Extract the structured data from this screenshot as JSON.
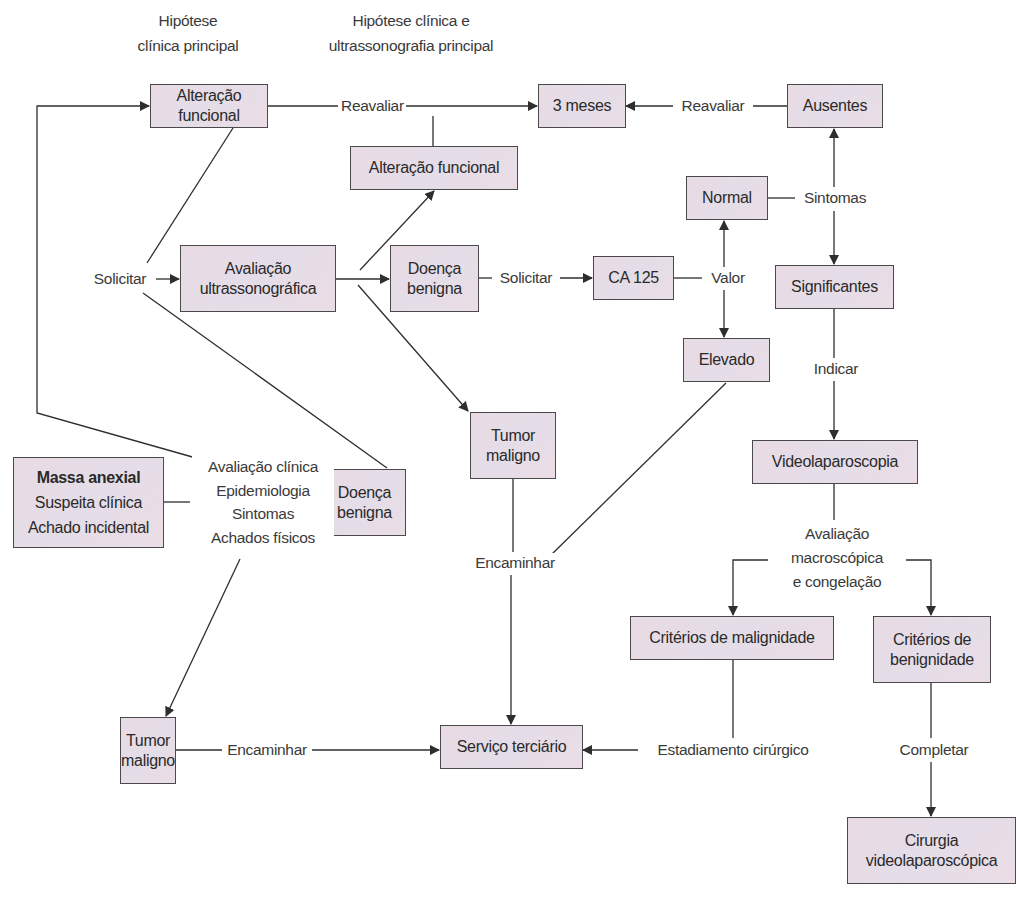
{
  "headers": {
    "col1": "Hipótese\nclínica principal",
    "col2": "Hipótese clínica e\nultrassonografia principal"
  },
  "nodes": {
    "alteracao_funcional_top": "Alteração funcional",
    "tres_meses": "3 meses",
    "ausentes": "Ausentes",
    "alteracao_funcional_us": "Alteração funcional",
    "normal": "Normal",
    "avaliacao_us": "Avaliação\nultrassonográfica",
    "doenca_benigna_us": "Doença\nbenigna",
    "ca125": "CA 125",
    "significantes": "Significantes",
    "elevado": "Elevado",
    "tumor_maligno_us": "Tumor\nmaligno",
    "videolaparoscopia": "Videolaparoscopia",
    "massa_anexial": {
      "title": "Massa anexial",
      "lines": "Suspeita clínica\nAchado incidental"
    },
    "doenca_benigna_clin": "Doença\nbenigna",
    "criterios_malignidade": "Critérios de malignidade",
    "criterios_benignidade": "Critérios de\nbenignidade",
    "tumor_maligno_clin": "Tumor\nmaligno",
    "servico_terciario": "Serviço terciário",
    "cirurgia_video": "Cirurgia\nvideolaparoscópica"
  },
  "edge_labels": {
    "reavaliar_left": "Reavaliar",
    "reavaliar_right": "Reavaliar",
    "sintomas": "Sintomas",
    "solicitar_us": "Solicitar",
    "solicitar_ca125": "Solicitar",
    "valor": "Valor",
    "indicar": "Indicar",
    "avaliacao_clinica_block": "Avaliação clínica\nEpidemiologia\nSintomas\nAchados físicos",
    "encaminhar_middle": "Encaminhar",
    "encaminhar_bottom": "Encaminhar",
    "avaliacao_macro": "Avaliação\nmacroscópica\ne congelação",
    "estadiamento": "Estadiamento cirúrgico",
    "completar": "Completar"
  },
  "colors": {
    "node_fill": "#e8dce6",
    "node_border": "#4a4a4a",
    "line": "#2e2e2e",
    "text": "#2a2a2a"
  }
}
